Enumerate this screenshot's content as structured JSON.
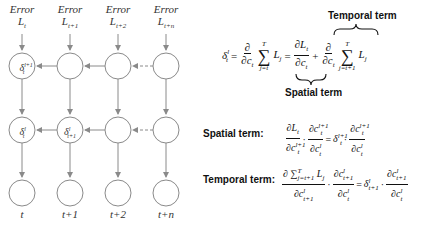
{
  "diagram": {
    "columns": [
      {
        "error_label": "Error",
        "loss": "L",
        "loss_sub": "t",
        "time": "t"
      },
      {
        "error_label": "Error",
        "loss": "L",
        "loss_sub": "t+1",
        "time": "t+1"
      },
      {
        "error_label": "Error",
        "loss": "L",
        "loss_sub": "t+2",
        "time": "t+2"
      },
      {
        "error_label": "Error",
        "loss": "L",
        "loss_sub": "t+n",
        "time": "t+n"
      }
    ],
    "nodes": {
      "top_left": {
        "sym": "δ",
        "sub": "t",
        "sup": "l+1"
      },
      "mid_left": {
        "sym": "δ",
        "sub": "t",
        "sup": "l"
      },
      "mid_second": {
        "sym": "δ",
        "sub": "t+1",
        "sup": "l"
      }
    },
    "colors": {
      "stroke": "#8a8a8a",
      "text": "#222222"
    }
  },
  "equations": {
    "main": {
      "lhs": "δ",
      "lhs_sub": "t",
      "lhs_sup": "l",
      "eq": "=",
      "partial": "∂",
      "c": "c",
      "sum_upper": "T",
      "sum_lower_1": "j=t",
      "sum_lower_2": "j=t+1",
      "L": "L",
      "L_sub_j": "j",
      "L_sub_t": "t",
      "plus": "+",
      "sigma": "∑"
    },
    "temporal_brace_label": "Temporal term",
    "spatial_brace_label": "Spatial term",
    "spatial": {
      "label": "Spatial term:",
      "text": "∂L_t/∂c_t^{l+1} · ∂c_t^{l+1}/∂c_t^l = δ_t^{l+1} · ∂c_t^{l+1}/∂c_t^l"
    },
    "temporal": {
      "label": "Temporal term:",
      "text": "∂Σ_{j=t+1}^T L_j/∂c_{t+1}^l · ∂c_{t+1}^l/∂c_t^l = δ_{t+1}^l · ∂c_{t+1}^l/∂c_t^l"
    }
  }
}
